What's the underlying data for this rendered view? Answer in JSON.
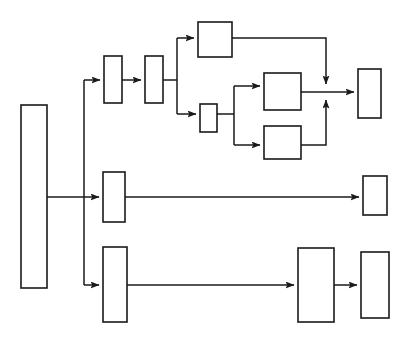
{
  "canvas": {
    "width": 408,
    "height": 344,
    "background": "#ffffff",
    "title": "Blank block flow diagram"
  },
  "style": {
    "node_stroke": "#1a1a1a",
    "node_fill": "#ffffff",
    "node_stroke_width": 1.6,
    "edge_stroke": "#1a1a1a",
    "edge_stroke_width": 1.5,
    "arrowhead": "solid-triangle"
  },
  "chart_data": {
    "type": "diagram",
    "subtype": "block-flow-diagram",
    "title": "",
    "labels_present": false,
    "node_count": 12,
    "edge_count": 14,
    "nodes": [
      {
        "id": "n1",
        "name": "source-block",
        "x": 21,
        "y": 105,
        "w": 26,
        "h": 183,
        "label": ""
      },
      {
        "id": "n2",
        "name": "branch-a-stage-1",
        "x": 104,
        "y": 56,
        "w": 18,
        "h": 47,
        "label": ""
      },
      {
        "id": "n3",
        "name": "branch-a-stage-2",
        "x": 145,
        "y": 56,
        "w": 18,
        "h": 47,
        "label": ""
      },
      {
        "id": "n4",
        "name": "branch-a-upper-block",
        "x": 198,
        "y": 22,
        "w": 34,
        "h": 35,
        "label": ""
      },
      {
        "id": "n5",
        "name": "branch-a-lower-stage",
        "x": 200,
        "y": 104,
        "w": 17,
        "h": 28,
        "label": ""
      },
      {
        "id": "n6",
        "name": "branch-a-sub-upper",
        "x": 264,
        "y": 73,
        "w": 37,
        "h": 37,
        "label": ""
      },
      {
        "id": "n7",
        "name": "branch-a-sub-lower",
        "x": 264,
        "y": 126,
        "w": 37,
        "h": 33,
        "label": ""
      },
      {
        "id": "n8",
        "name": "branch-a-sink",
        "x": 358,
        "y": 69,
        "w": 23,
        "h": 49,
        "label": ""
      },
      {
        "id": "n9",
        "name": "branch-b-stage",
        "x": 103,
        "y": 172,
        "w": 22,
        "h": 50,
        "label": ""
      },
      {
        "id": "n10",
        "name": "branch-b-sink",
        "x": 363,
        "y": 176,
        "w": 24,
        "h": 39,
        "label": ""
      },
      {
        "id": "n11",
        "name": "branch-c-stage",
        "x": 103,
        "y": 247,
        "w": 24,
        "h": 75,
        "label": ""
      },
      {
        "id": "n12",
        "name": "branch-c-block",
        "x": 298,
        "y": 248,
        "w": 36,
        "h": 74,
        "label": ""
      },
      {
        "id": "n13",
        "name": "branch-c-sink",
        "x": 361,
        "y": 252,
        "w": 28,
        "h": 66,
        "label": ""
      }
    ],
    "edges": [
      {
        "id": "e1",
        "name": "source-to-trunk",
        "from": "n1",
        "to": "trunk",
        "d": "M47,197 L84,197",
        "arrow": false
      },
      {
        "id": "e2",
        "name": "trunk-vertical",
        "from": "trunk",
        "to": "trunk",
        "d": "M84,80 L84,285",
        "arrow": false
      },
      {
        "id": "e3",
        "name": "trunk-to-branch-a",
        "from": "trunk",
        "to": "n2",
        "d": "M84,80 L100,80",
        "arrow": true
      },
      {
        "id": "e4",
        "name": "trunk-to-branch-b",
        "from": "trunk",
        "to": "n9",
        "d": "M84,197 L99,197",
        "arrow": true
      },
      {
        "id": "e5",
        "name": "trunk-to-branch-c",
        "from": "trunk",
        "to": "n11",
        "d": "M84,285 L99,285",
        "arrow": true
      },
      {
        "id": "e6",
        "name": "branch-a-stage1-to-stage2",
        "from": "n2",
        "to": "n3",
        "d": "M122,80 L141,80",
        "arrow": true
      },
      {
        "id": "e7",
        "name": "branch-a-split",
        "from": "n3",
        "to": "split",
        "d": "M163,80 L177,80 M177,38 L177,114",
        "arrow": false
      },
      {
        "id": "e8",
        "name": "branch-a-split-to-upper",
        "from": "split",
        "to": "n4",
        "d": "M177,38 L194,38",
        "arrow": true
      },
      {
        "id": "e9",
        "name": "branch-a-split-to-lower",
        "from": "split",
        "to": "n5",
        "d": "M177,114 L196,114",
        "arrow": true
      },
      {
        "id": "e10",
        "name": "branch-a-upper-to-merge",
        "from": "n4",
        "to": "merge",
        "d": "M232,38 L326,38 L326,84",
        "arrow": true
      },
      {
        "id": "e11",
        "name": "branch-a-lower-split",
        "from": "n5",
        "to": "split2",
        "d": "M217,114 L234,114 M234,86 L234,145",
        "arrow": false
      },
      {
        "id": "e12",
        "name": "branch-a-split2-to-sub-upper",
        "from": "split2",
        "to": "n6",
        "d": "M234,86 L260,86",
        "arrow": true
      },
      {
        "id": "e13",
        "name": "branch-a-split2-to-sub-lower",
        "from": "split2",
        "to": "n7",
        "d": "M234,145 L260,145",
        "arrow": true
      },
      {
        "id": "e14",
        "name": "branch-a-sub-upper-to-merge",
        "from": "n6",
        "to": "merge",
        "d": "M301,92 L354,92",
        "arrow": true
      },
      {
        "id": "e15",
        "name": "branch-a-sub-lower-to-merge",
        "from": "n7",
        "to": "merge",
        "d": "M301,145 L326,145 L326,100",
        "arrow": true
      },
      {
        "id": "e16",
        "name": "branch-b-stage-to-sink",
        "from": "n9",
        "to": "n10",
        "d": "M125,197 L359,197",
        "arrow": true
      },
      {
        "id": "e17",
        "name": "branch-c-stage-to-block",
        "from": "n11",
        "to": "n12",
        "d": "M127,285 L294,285",
        "arrow": true
      },
      {
        "id": "e18",
        "name": "branch-c-block-to-sink",
        "from": "n12",
        "to": "n13",
        "d": "M334,285 L357,285",
        "arrow": true
      }
    ],
    "merge_points": [
      {
        "name": "branch-a-merge-junction",
        "x": 326,
        "y": 92,
        "incoming": 3
      }
    ],
    "layout_hints": {
      "orientation": "left-to-right",
      "branches": 3,
      "grid": false,
      "legend": false
    }
  }
}
